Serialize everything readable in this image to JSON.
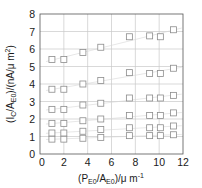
{
  "chart_data": {
    "type": "scatter",
    "title": "",
    "xlabel": "(P_E0/A_E0)/μ m^-1",
    "ylabel": "(I_C/A_E0)/(nA/μ m^2)",
    "xlim": [
      0,
      12
    ],
    "ylim": [
      0,
      8
    ],
    "xticks": [
      0,
      2,
      4,
      6,
      8,
      10,
      12
    ],
    "yticks": [
      0,
      1,
      2,
      3,
      4,
      5,
      6,
      7,
      8
    ],
    "grid": true,
    "legend": null,
    "marker": "open-square",
    "marker_color": "#8c8c8c",
    "grid_color": "#c8c8c8",
    "x": [
      1.0,
      2.0,
      3.6,
      5.1,
      7.5,
      9.2,
      10.1,
      11.2
    ],
    "series": [
      {
        "name": "s1",
        "values": [
          0.85,
          0.85,
          0.9,
          0.95,
          1.05,
          1.05,
          1.05,
          1.1
        ]
      },
      {
        "name": "s2",
        "values": [
          1.2,
          1.2,
          1.3,
          1.4,
          1.5,
          1.5,
          1.5,
          1.6
        ]
      },
      {
        "name": "s3",
        "values": [
          1.75,
          1.75,
          1.9,
          2.0,
          2.2,
          2.2,
          2.2,
          2.35
        ]
      },
      {
        "name": "s4",
        "values": [
          2.55,
          2.55,
          2.8,
          2.9,
          3.2,
          3.2,
          3.2,
          3.35
        ]
      },
      {
        "name": "s5",
        "values": [
          3.7,
          3.7,
          4.0,
          4.2,
          4.65,
          4.6,
          4.6,
          4.9
        ]
      },
      {
        "name": "s6",
        "values": [
          5.4,
          5.4,
          5.8,
          6.1,
          6.7,
          6.75,
          6.7,
          7.1
        ]
      }
    ]
  },
  "axes": {
    "x_label_main": "(P",
    "x_label_sub1": "E0",
    "x_label_mid": "/A",
    "x_label_sub2": "E0",
    "x_label_end": ")/μ m",
    "x_label_sup": "-1",
    "y_label_main": "(I",
    "y_label_sub1": "C",
    "y_label_mid": "/A",
    "y_label_sub2": "E0",
    "y_label_end": ")/(nA/μ m",
    "y_label_sup": "2",
    "y_label_close": ")"
  }
}
